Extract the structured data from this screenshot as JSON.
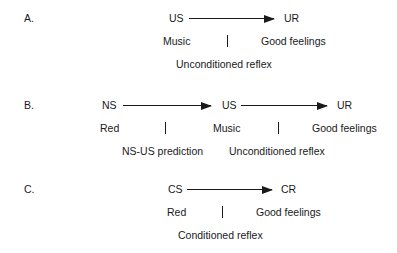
{
  "panels": [
    {
      "label": "A.",
      "nodes": [
        "US",
        "UR"
      ],
      "examples": [
        "Music",
        "Good feelings"
      ],
      "relations": [
        "Unconditioned reflex"
      ]
    },
    {
      "label": "B.",
      "nodes": [
        "NS",
        "US",
        "UR"
      ],
      "examples": [
        "Red",
        "Music",
        "Good feelings"
      ],
      "relations": [
        "NS-US prediction",
        "Unconditioned reflex"
      ]
    },
    {
      "label": "C.",
      "nodes": [
        "CS",
        "CR"
      ],
      "examples": [
        "Red",
        "Good feelings"
      ],
      "relations": [
        "Conditioned reflex"
      ]
    }
  ]
}
